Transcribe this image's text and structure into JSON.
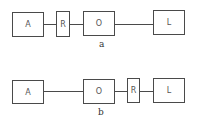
{
  "diagrams": [
    {
      "caption": "a",
      "order": [
        "A",
        "R",
        "O",
        "L"
      ],
      "boxes": {
        "A": "A",
        "R": "R",
        "O": "O",
        "L": "L"
      }
    },
    {
      "caption": "b",
      "order": [
        "A",
        "O",
        "R",
        "L"
      ],
      "boxes": {
        "A": "A",
        "O": "O",
        "R": "R",
        "L": "L"
      }
    }
  ]
}
